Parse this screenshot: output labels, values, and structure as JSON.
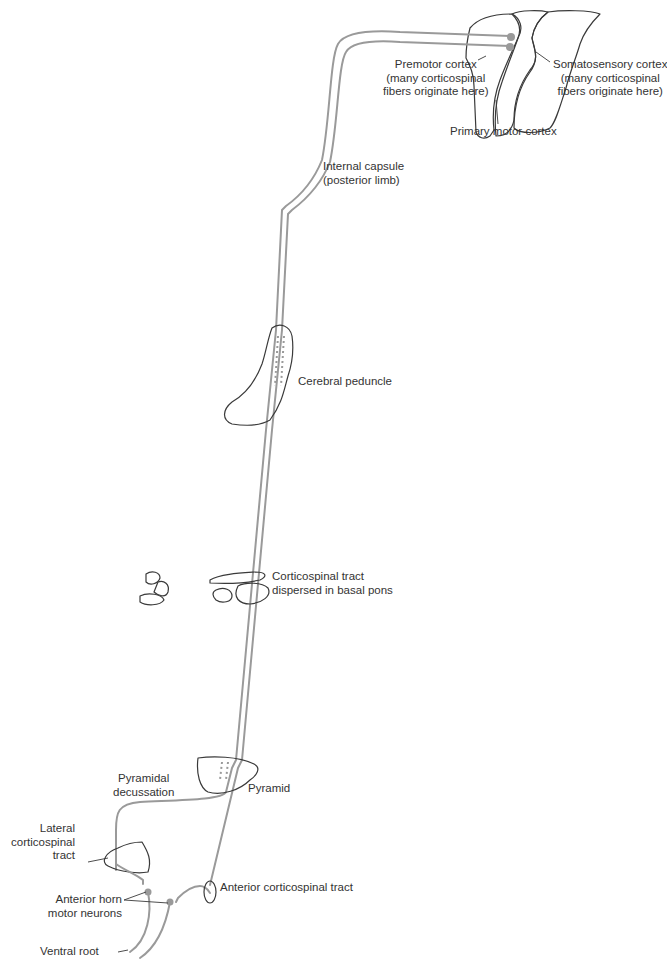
{
  "diagram": {
    "colors": {
      "tract": "#9a9a9a",
      "outline": "#3a3a3a",
      "text": "#333333"
    },
    "labels": {
      "premotor": "Premotor cortex\n(many corticospinal\nfibers originate here)",
      "somatosensory": "Somatosensory cortex\n(many corticospinal\nfibers originate here)",
      "primary_motor": "Primary motor cortex",
      "internal_capsule": "Internal capsule\n(posterior limb)",
      "cerebral_peduncle": "Cerebral peduncle",
      "basal_pons": "Corticospinal tract\ndispersed in basal pons",
      "pyramidal_decussation": "Pyramidal\ndecussation",
      "pyramid": "Pyramid",
      "lateral_tract": "Lateral\ncorticospinal\ntract",
      "anterior_horn": "Anterior horn\nmotor neurons",
      "ventral_root": "Ventral root",
      "anterior_tract": "Anterior corticospinal tract"
    }
  }
}
